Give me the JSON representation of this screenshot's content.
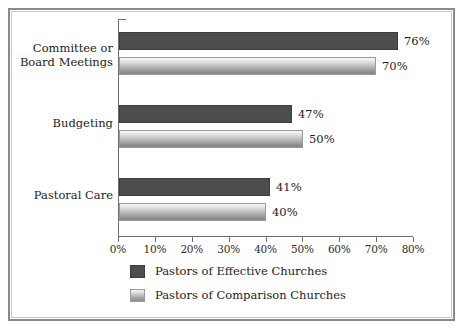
{
  "chart_data": {
    "type": "bar",
    "orientation": "horizontal",
    "title": "",
    "xlabel": "",
    "ylabel": "",
    "xlim": [
      0,
      80
    ],
    "xtick_labels": [
      "0%",
      "10%",
      "20%",
      "30%",
      "40%",
      "50%",
      "60%",
      "70%",
      "80%"
    ],
    "xtick_values": [
      0,
      10,
      20,
      30,
      40,
      50,
      60,
      70,
      80
    ],
    "grid": false,
    "legend_position": "bottom-left",
    "categories": [
      "Committee or\nBoard Meetings",
      "Budgeting",
      "Pastoral Care"
    ],
    "series": [
      {
        "name": "Pastors of Effective Churches",
        "color": "#4d4d4d",
        "values": [
          76,
          47,
          41
        ],
        "value_labels": [
          "76%",
          "47%",
          "41%"
        ]
      },
      {
        "name": "Pastors of Comparison Churches",
        "color": "#b4b4b4",
        "values": [
          70,
          50,
          40
        ],
        "value_labels": [
          "70%",
          "50%",
          "40%"
        ]
      }
    ]
  },
  "legend": {
    "items": [
      {
        "label": "Pastors of Effective Churches"
      },
      {
        "label": "Pastors of Comparison Churches"
      }
    ]
  },
  "frame": {
    "border_color": "#8a8a8a",
    "background": "#ffffff"
  }
}
